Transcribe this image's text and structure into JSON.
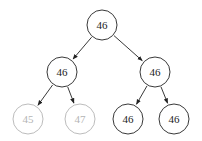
{
  "diagram": {
    "type": "binary-tree",
    "colors": {
      "active": "#222222",
      "faded": "#b4b4b4",
      "background": "#ffffff"
    },
    "node_radius": 15,
    "nodes": [
      {
        "id": "root",
        "value": "46",
        "x": 102,
        "y": 25,
        "style": "active"
      },
      {
        "id": "left",
        "value": "46",
        "x": 62,
        "y": 72,
        "style": "active"
      },
      {
        "id": "right",
        "value": "46",
        "x": 155,
        "y": 72,
        "style": "active"
      },
      {
        "id": "left-left",
        "value": "45",
        "x": 28,
        "y": 119,
        "style": "faded"
      },
      {
        "id": "left-right",
        "value": "47",
        "x": 80,
        "y": 119,
        "style": "faded"
      },
      {
        "id": "right-left",
        "value": "46",
        "x": 128,
        "y": 119,
        "style": "active"
      },
      {
        "id": "right-right",
        "value": "46",
        "x": 174,
        "y": 119,
        "style": "active"
      }
    ],
    "edges": [
      {
        "from": "root",
        "to": "left"
      },
      {
        "from": "root",
        "to": "right"
      },
      {
        "from": "left",
        "to": "left-left"
      },
      {
        "from": "left",
        "to": "left-right"
      },
      {
        "from": "right",
        "to": "right-left"
      },
      {
        "from": "right",
        "to": "right-right"
      }
    ]
  }
}
